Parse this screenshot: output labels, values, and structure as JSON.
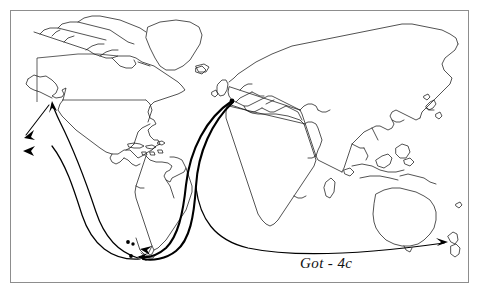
{
  "figure": {
    "caption": "Got - 4c",
    "background_color": "#ffffff",
    "frame_color": "#8d8d8d",
    "line_color": "#1a1a1a",
    "route_color": "#000000"
  },
  "map": {
    "projection_note": "equirectangular world map outline",
    "landmasses": [
      "North America",
      "Greenland",
      "South America",
      "Europe",
      "Africa",
      "Asia",
      "Australia",
      "New Zealand",
      "Indonesia",
      "Philippines",
      "Japan",
      "Iceland",
      "British Isles",
      "Madagascar",
      "Caribbean islands"
    ]
  },
  "routes": [
    {
      "id": "route-europe-south-america",
      "label": "Europe to southern South America",
      "from": "Europe (English Channel)",
      "to": "Southern South America",
      "style": "thick"
    },
    {
      "id": "route-europe-south-america-2",
      "label": "Europe to southern South America (second leg)",
      "from": "Europe (English Channel)",
      "to": "Southern South America",
      "style": "thick"
    },
    {
      "id": "route-south-america-north-pacific",
      "label": "Southern South America to North American west coast",
      "from": "Southern South America",
      "to": "North American west coast",
      "style": "normal"
    },
    {
      "id": "route-south-america-eastern-pacific",
      "label": "Southern South America to eastern Pacific",
      "from": "Southern South America",
      "to": "Eastern Pacific Ocean",
      "style": "normal"
    },
    {
      "id": "route-north-pacific-west",
      "label": "North American west coast westward into Pacific",
      "from": "North American west coast",
      "to": "Pacific Ocean (west)",
      "style": "normal"
    },
    {
      "id": "route-africa-new-zealand",
      "label": "South Atlantic around Africa to New Zealand",
      "from": "South Atlantic Ocean",
      "to": "New Zealand",
      "style": "normal"
    }
  ],
  "markers": [
    {
      "id": "origin-europe",
      "label": "Voyage origin point, Europe",
      "type": "dot"
    },
    {
      "id": "stop-south-america-a",
      "label": "Stop, southern South America",
      "type": "dot"
    },
    {
      "id": "stop-south-america-b",
      "label": "Stop, Tierra del Fuego",
      "type": "dot"
    },
    {
      "id": "stop-south-america-c",
      "label": "Stop, Falkland area",
      "type": "dot"
    }
  ],
  "arrowheads": [
    {
      "id": "arrow-pacific-west-1",
      "label": "Arrow pointing west into Pacific"
    },
    {
      "id": "arrow-pacific-west-2",
      "label": "Arrow pointing west into Pacific (lower)"
    },
    {
      "id": "arrow-north-america-coast",
      "label": "Arrow pointing to North American west coast"
    },
    {
      "id": "arrow-south-america-1",
      "label": "Arrow pointing to southern South America"
    },
    {
      "id": "arrow-south-america-2",
      "label": "Arrow pointing to southern South America (second)"
    },
    {
      "id": "arrow-new-zealand",
      "label": "Arrow pointing to New Zealand"
    }
  ]
}
